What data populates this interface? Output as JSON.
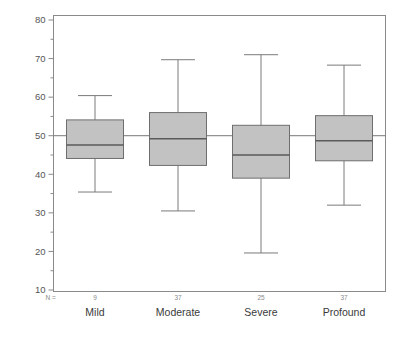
{
  "chart_data": {
    "type": "box",
    "title": "",
    "xlabel": "",
    "ylabel": "Standardized POP",
    "ylim": [
      10,
      80
    ],
    "ytick_step": 10,
    "yminor_step": 5,
    "ytick_labels": [
      "80",
      "70",
      "60",
      "50",
      "40",
      "30",
      "20",
      "10"
    ],
    "ytick_values": [
      80,
      70,
      60,
      50,
      40,
      30,
      20,
      10
    ],
    "grid": false,
    "legend": null,
    "reference_line": {
      "value": 50,
      "label": "50"
    },
    "n_row_header": "N =",
    "categories": [
      "Mild",
      "Moderate",
      "Severe",
      "Profound"
    ],
    "counts": [
      9,
      37,
      25,
      37
    ],
    "count_labels": [
      "9",
      "37",
      "25",
      "37"
    ],
    "boxes": [
      {
        "category": "Mild",
        "n": 9,
        "whisker_low": 35.4,
        "q1": 44.1,
        "median": 47.6,
        "q3": 54.1,
        "whisker_high": 60.4
      },
      {
        "category": "Moderate",
        "n": 37,
        "whisker_low": 30.5,
        "q1": 42.3,
        "median": 49.2,
        "q3": 56.0,
        "whisker_high": 69.7
      },
      {
        "category": "Severe",
        "n": 25,
        "whisker_low": 19.6,
        "q1": 39.0,
        "median": 45.0,
        "q3": 52.7,
        "whisker_high": 71.0
      },
      {
        "category": "Profound",
        "n": 37,
        "whisker_low": 32.0,
        "q1": 43.5,
        "median": 48.7,
        "q3": 55.2,
        "whisker_high": 68.3
      }
    ],
    "colors": {
      "box_fill": "#c2c2c2",
      "box_edge": "#6e6e6e",
      "median": "#5a5a5a",
      "whisker": "#7a7a7a",
      "axis": "#8a8a8a",
      "text": "#555555",
      "reference_line": "#777777",
      "background": "#ffffff"
    }
  }
}
